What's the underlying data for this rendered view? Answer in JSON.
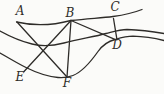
{
  "labels": {
    "A": "A",
    "B": "B",
    "C": "C",
    "D": "D",
    "E": "E",
    "F": "F"
  },
  "colors": {
    "ink": "#2e2c29",
    "background": "#fbfbf9"
  }
}
